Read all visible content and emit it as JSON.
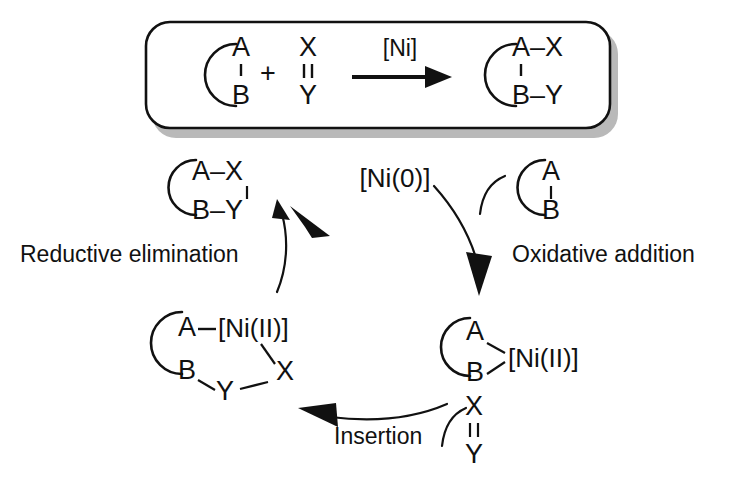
{
  "figure": {
    "type": "catalytic-cycle-diagram",
    "background_color": "#ffffff",
    "ink_color": "#111111",
    "shadow_color": "#b9b9b9"
  },
  "overall_reaction_box": {
    "substrate": {
      "ring_label": "ring",
      "top_atom": "A",
      "bottom_atom": "B",
      "bond": "single"
    },
    "plus_sign": "+",
    "reagent": {
      "top_atom": "X",
      "bottom_atom": "Y",
      "bond": "double"
    },
    "arrow_label": "[Ni]",
    "product": {
      "top_pair": "A–X",
      "bottom_pair": "B–Y",
      "bond": "single"
    }
  },
  "cycle": {
    "catalyst_label": "[Ni(0)]",
    "steps": [
      {
        "id": "oxidative-addition",
        "label": "Oxidative addition"
      },
      {
        "id": "insertion",
        "label": "Insertion"
      },
      {
        "id": "reductive-elimination",
        "label": "Reductive elimination"
      }
    ],
    "entering_substrate": {
      "top_atom": "A",
      "bottom_atom": "B",
      "bond": "single"
    },
    "entering_reagent": {
      "top_atom": "X",
      "bottom_atom": "Y",
      "bond": "double"
    },
    "released_product": {
      "top_pair": "A–X",
      "bottom_pair": "B–Y",
      "bond": "single"
    },
    "intermediates": [
      {
        "id": "nickelacycle",
        "position": "bottom-right",
        "atom_a": "A",
        "atom_b": "B",
        "metal": "[Ni(II)]"
      },
      {
        "id": "inserted-nickelacycle",
        "position": "bottom-left",
        "atom_a": "A",
        "atom_b": "B",
        "metal": "[Ni(II)]",
        "atom_x": "X",
        "atom_y": "Y"
      }
    ]
  },
  "glyphs": {
    "plus": "+",
    "en_dash": "–"
  }
}
